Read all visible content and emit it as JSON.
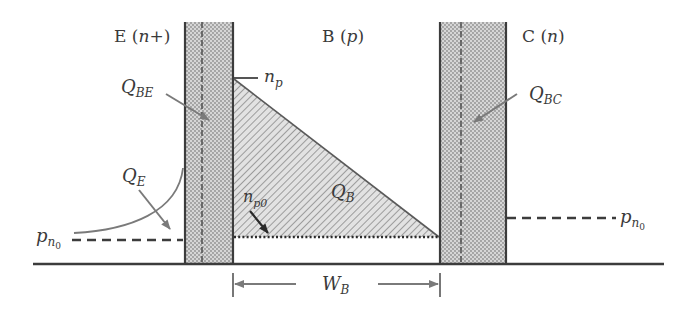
{
  "regions": {
    "emitter": {
      "letter": "E",
      "type_open": " (",
      "type": "n+",
      "type_close": ")"
    },
    "base": {
      "letter": "B",
      "type_open": " (",
      "type": "p",
      "type_close": ")"
    },
    "collector": {
      "letter": "C",
      "type_open": " (",
      "type": "n",
      "type_close": ")"
    }
  },
  "labels": {
    "np": {
      "main": "n",
      "sub": "p"
    },
    "np0": {
      "main": "n",
      "sub": "p0"
    },
    "QBE": {
      "main": "Q",
      "sub": "BE"
    },
    "QBC": {
      "main": "Q",
      "sub": "BC"
    },
    "QE": {
      "main": "Q",
      "sub": "E"
    },
    "QB": {
      "main": "Q",
      "sub": "B"
    },
    "pn0_left": {
      "main": "p",
      "sub": "n",
      "subsub": "0"
    },
    "pn0_right": {
      "main": "p",
      "sub": "n",
      "subsub": "0"
    },
    "WB": {
      "main": "W",
      "sub": "B"
    }
  },
  "colors": {
    "line": "#3c3c3c",
    "depletion_fill": "#c8c8c8",
    "hatch": "#8a8a8a",
    "arrow": "#7a7a7a"
  }
}
